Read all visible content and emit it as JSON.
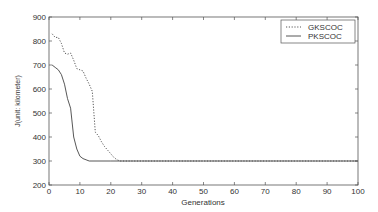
{
  "chart_data": {
    "type": "line",
    "title": "",
    "xlabel": "Generations",
    "ylabel": "J(unit: kilometer)",
    "xlim": [
      0,
      100
    ],
    "ylim": [
      200,
      900
    ],
    "xticks": [
      0,
      10,
      20,
      30,
      40,
      50,
      60,
      70,
      80,
      90,
      100
    ],
    "yticks": [
      200,
      300,
      400,
      500,
      600,
      700,
      800,
      900
    ],
    "grid": false,
    "legend_position": "upper right",
    "series": [
      {
        "name": "GKSCOC",
        "style": "dotted",
        "x": [
          1,
          2,
          3,
          4,
          5,
          6,
          7,
          8,
          9,
          10,
          11,
          12,
          13,
          14,
          15,
          16,
          17,
          18,
          19,
          20,
          21,
          22,
          23,
          30,
          40,
          50,
          60,
          70,
          80,
          90,
          100
        ],
        "values": [
          830,
          815,
          815,
          790,
          750,
          745,
          750,
          720,
          685,
          680,
          675,
          645,
          620,
          590,
          420,
          405,
          380,
          360,
          345,
          330,
          315,
          305,
          300,
          300,
          300,
          300,
          300,
          300,
          300,
          300,
          300
        ]
      },
      {
        "name": "PKSCOC",
        "style": "solid",
        "x": [
          1,
          2,
          3,
          4,
          5,
          6,
          7,
          8,
          9,
          10,
          11,
          12,
          13,
          20,
          30,
          40,
          50,
          60,
          70,
          80,
          90,
          100
        ],
        "values": [
          700,
          690,
          680,
          660,
          620,
          560,
          520,
          400,
          350,
          320,
          310,
          305,
          300,
          300,
          300,
          300,
          300,
          300,
          300,
          300,
          300,
          300
        ]
      }
    ]
  }
}
